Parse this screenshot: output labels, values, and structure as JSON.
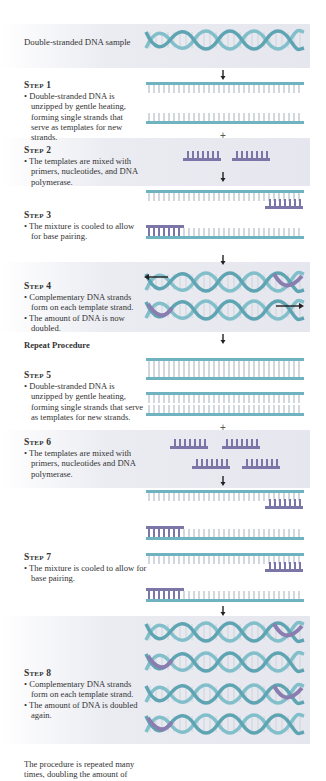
{
  "intro": {
    "label": "Double-stranded DNA sample"
  },
  "steps": [
    {
      "title": "Step 1",
      "bullets": [
        "Double-stranded DNA is unzipped by gentle heating, forming single strands that serve as templates for new strands."
      ]
    },
    {
      "title": "Step 2",
      "bullets": [
        "The templates are mixed with primers, nucleotides, and DNA polymerase."
      ]
    },
    {
      "title": "Step 3",
      "bullets": [
        "The mixture is cooled to allow for base pairing."
      ]
    },
    {
      "title": "Step 4",
      "bullets": [
        "Complementary DNA strands form on each template strand.",
        "The amount of DNA is now doubled."
      ]
    },
    {
      "title": "Step 5",
      "bullets": [
        "Double-stranded DNA is unzipped by gentle heating, forming single strands that serve as templates for new strands."
      ]
    },
    {
      "title": "Step 6",
      "bullets": [
        "The templates are mixed with primers, nucleotides and DNA polymerase."
      ]
    },
    {
      "title": "Step 7",
      "bullets": [
        "The mixture is cooled to allow for base pairing."
      ]
    },
    {
      "title": "Step 8",
      "bullets": [
        "Complementary DNA strands form on each template strand.",
        "The amount of DNA is doubled again."
      ]
    }
  ],
  "repeat": {
    "label": "Repeat Procedure"
  },
  "footer": {
    "text": "The procedure is repeated many times, doubling the amount of"
  },
  "symbols": {
    "plus": "+"
  },
  "colors": {
    "strand": "#6fb3c0",
    "primer": "#7a76a8",
    "panel": "#e8e9f0",
    "arrow": "#222222"
  }
}
